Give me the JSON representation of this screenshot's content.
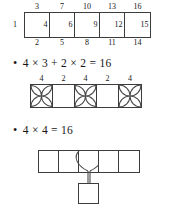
{
  "figures": {
    "top_strip": {
      "name": "numbered-strip",
      "left_label": "1",
      "cells": [
        {
          "top": "3",
          "inner": "4",
          "bottom": "2"
        },
        {
          "top": "7",
          "inner": "6",
          "bottom": "5"
        },
        {
          "top": "10",
          "inner": "9",
          "bottom": "8"
        },
        {
          "top": "13",
          "inner": "12",
          "bottom": "11"
        },
        {
          "top": "16",
          "inner": "15",
          "bottom": "14"
        }
      ]
    },
    "mid_strip": {
      "name": "star-strip",
      "cells": [
        {
          "top": "4",
          "pattern": "star"
        },
        {
          "top": "2",
          "pattern": "empty"
        },
        {
          "top": "4",
          "pattern": "star"
        },
        {
          "top": "2",
          "pattern": "empty"
        },
        {
          "top": "4",
          "pattern": "star"
        }
      ]
    },
    "bottom_strip": {
      "name": "lens-strip",
      "cells": [
        {
          "pattern": "empty"
        },
        {
          "pattern": "empty"
        },
        {
          "pattern": "lens"
        },
        {
          "pattern": "empty"
        },
        {
          "pattern": "empty"
        }
      ],
      "pendant": {
        "name": "pendant-square"
      }
    }
  },
  "equations": [
    {
      "bullet": "•",
      "text": "4 × 3 + 2 × 2 = 16",
      "a": "4",
      "op1": "×",
      "b": "3",
      "op2": "+",
      "c": "2",
      "op3": "×",
      "d": "2",
      "eq": "=",
      "result": "16"
    },
    {
      "bullet": "•",
      "text": "4 × 4 = 16",
      "a": "4",
      "op1": "×",
      "b": "4",
      "eq": "=",
      "result": "16"
    }
  ],
  "colors": {
    "ink": "#1b1b1b",
    "rule": "#3c3c3c",
    "curve": "#4a4a4a",
    "paper": "#ffffff"
  }
}
